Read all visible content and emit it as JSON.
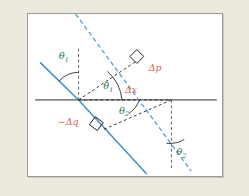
{
  "figure": {
    "background_color": "#eceadf",
    "panel_color": "#ffffff",
    "border_color": "#9a9a96",
    "colors": {
      "ray": "#3b8fc4",
      "axis": "#585858",
      "construction": "#1a1a1a",
      "angle_label": "#2a7a5a",
      "vector_label": "#e0604f"
    },
    "labels": {
      "theta1_upper": {
        "symbol": "θ",
        "subscript": "1",
        "color": "#2a7a5a",
        "x": 72,
        "y": 64
      },
      "theta1_lower": {
        "symbol": "θ",
        "subscript": "1",
        "color": "#2a7a5a",
        "x": 110,
        "y": 91
      },
      "theta2_middle": {
        "symbol": "θ",
        "subscript": "2",
        "color": "#2a7a5a",
        "x": 120,
        "y": 115
      },
      "theta2_lower_right": {
        "symbol": "θ",
        "subscript": "2",
        "color": "#2a7a5a",
        "x": 186,
        "y": 155
      },
      "delta_p": {
        "text": "Δp",
        "color": "#e0604f",
        "x": 152,
        "y": 72
      },
      "delta_x": {
        "text": "Δx",
        "color": "#e0604f",
        "x": 128,
        "y": 92
      },
      "minus_delta_q": {
        "text": "−Δq",
        "color": "#e0604f",
        "x": 63,
        "y": 122
      }
    },
    "geometry": {
      "left_vertex": {
        "x": 78,
        "y": 100
      },
      "right_vertex": {
        "x": 172,
        "y": 100
      },
      "horizontal_axis": {
        "x1": 34,
        "y1": 100,
        "x2": 218,
        "y2": 100
      },
      "incident_ray_solid": {
        "x1": 39,
        "y1": 62,
        "x2": 78,
        "y2": 100
      },
      "refracted_ray_solid": {
        "x1": 78,
        "y1": 100,
        "x2": 147,
        "y2": 175
      },
      "extended_ray_dashed": {
        "x1": 75,
        "y1": 13,
        "x2": 192,
        "y2": 172
      },
      "normal_dashed_left": {
        "x1": 78,
        "y1": 48,
        "x2": 78,
        "y2": 100
      },
      "normal_dashed_right": {
        "x1": 172,
        "y1": 100,
        "x2": 172,
        "y2": 170
      }
    },
    "markers": {
      "right_angle_upper": {
        "x": 131,
        "y": 70
      },
      "right_angle_lower": {
        "x": 100,
        "y": 123
      }
    }
  }
}
